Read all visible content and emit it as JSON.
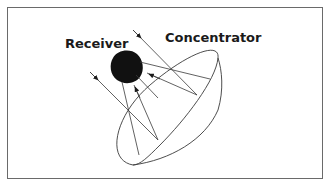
{
  "diagram": {
    "labels": {
      "receiver": "Receiver",
      "concentrator": "Concentrator"
    },
    "colors": {
      "line": "#3a3a3a",
      "receiver_fill": "#111111",
      "frame": "#6a6a6a",
      "background": "#ffffff"
    },
    "elements": [
      {
        "id": "receiver",
        "shape": "rounded-square",
        "fill": "black"
      },
      {
        "id": "concentrator",
        "shape": "dish (tilted ellipse)"
      },
      {
        "id": "incoming-ray-1",
        "direction": "toward dish",
        "arrow": true
      },
      {
        "id": "incoming-ray-2",
        "direction": "toward dish",
        "arrow": true
      },
      {
        "id": "reflected-ray-1",
        "direction": "toward receiver",
        "arrow": true
      },
      {
        "id": "reflected-ray-2",
        "direction": "toward receiver",
        "arrow": true
      }
    ]
  }
}
